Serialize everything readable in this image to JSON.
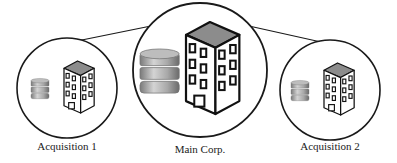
{
  "diagram": {
    "nodes": [
      {
        "id": "acq1",
        "label": "Acquisition 1",
        "cx": 67,
        "cy": 88,
        "r": 50,
        "size": "small"
      },
      {
        "id": "main",
        "label": "Main Corp.",
        "cx": 200,
        "cy": 70,
        "r": 67,
        "size": "large"
      },
      {
        "id": "acq2",
        "label": "Acquisition 2",
        "cx": 330,
        "cy": 90,
        "r": 50,
        "size": "small"
      }
    ],
    "edges": [
      {
        "from": "acq1",
        "to": "main"
      },
      {
        "from": "main",
        "to": "acq2"
      }
    ],
    "icons": [
      "database-icon",
      "office-building-icon"
    ],
    "colors": {
      "stroke": "#1a1a1a",
      "roof": "#8a8a8a",
      "db_light": "#c9c9c9",
      "db_dark": "#6e6e6e"
    }
  }
}
